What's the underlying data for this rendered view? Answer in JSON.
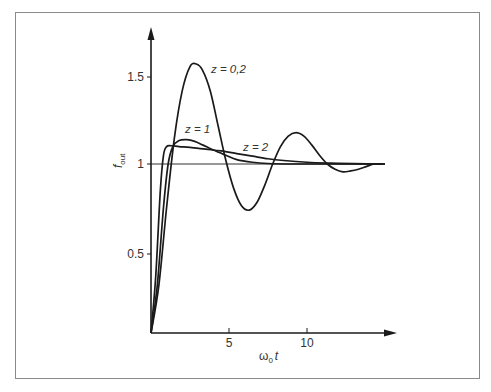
{
  "chart_data": {
    "type": "line",
    "title": "",
    "xlabel": "ω0 t",
    "ylabel": "f_out",
    "xlabel_main": "ω",
    "xlabel_sub": "0",
    "xlabel_var": "t",
    "ylabel_main": "f",
    "ylabel_sub": "out",
    "x_ticks": [
      5,
      10
    ],
    "x_tick_labels": [
      "5",
      "10"
    ],
    "y_ticks": [
      0.5,
      1,
      1.5
    ],
    "y_tick_labels": [
      "0.5",
      "1",
      "1.5"
    ],
    "xlim": [
      0,
      15.5
    ],
    "ylim": [
      0,
      1.75
    ],
    "grid": false,
    "reference_line": {
      "y": 1,
      "x_range": [
        0,
        15
      ]
    },
    "series": [
      {
        "name": "z = 0,2",
        "label": "z = 0,2",
        "x": [
          0,
          0.5,
          1,
          1.5,
          2,
          2.5,
          2.9,
          3.3,
          3.8,
          4.3,
          4.8,
          5.3,
          5.8,
          6.3,
          6.8,
          7.3,
          7.8,
          8.3,
          8.8,
          9.3,
          9.8,
          10.3,
          10.8,
          11.3,
          11.8,
          12.3,
          12.8,
          13.3,
          13.8,
          14.3,
          14.8
        ],
        "values": [
          0.0,
          0.3,
          0.75,
          1.15,
          1.42,
          1.56,
          1.575,
          1.54,
          1.42,
          1.22,
          1.02,
          0.86,
          0.76,
          0.735,
          0.78,
          0.88,
          1.0,
          1.1,
          1.16,
          1.18,
          1.16,
          1.11,
          1.05,
          1.0,
          0.97,
          0.955,
          0.96,
          0.97,
          0.985,
          1.0,
          1.0
        ]
      },
      {
        "name": "z = 1",
        "label": "z = 1",
        "x": [
          0,
          0.4,
          0.8,
          1.1,
          1.4,
          1.8,
          2.3,
          2.8,
          3.3,
          4.0,
          4.8,
          5.5,
          6.5,
          7.5,
          9,
          11,
          13,
          15
        ],
        "values": [
          0.0,
          0.3,
          0.75,
          1.0,
          1.1,
          1.135,
          1.14,
          1.13,
          1.11,
          1.08,
          1.05,
          1.025,
          1.01,
          1.003,
          1.0,
          1.0,
          1.0,
          1.0
        ]
      },
      {
        "name": "z = 2",
        "label": "z = 2",
        "x": [
          0,
          0.3,
          0.6,
          0.8,
          1.0,
          1.3,
          1.8,
          2.5,
          3.5,
          4.5,
          5.5,
          6.5,
          7.5,
          8.5,
          10,
          11.5,
          13,
          15
        ],
        "values": [
          0.0,
          0.35,
          0.85,
          1.05,
          1.1,
          1.105,
          1.1,
          1.095,
          1.085,
          1.075,
          1.06,
          1.045,
          1.03,
          1.02,
          1.01,
          1.005,
          1.002,
          1.0
        ]
      }
    ],
    "annotations": [
      {
        "text": "z = 0,2",
        "near_series": "z = 0,2",
        "x": 3.9,
        "y": 1.56
      },
      {
        "text": "z = 1",
        "near_series": "z = 1",
        "x": 2.0,
        "y": 1.21
      },
      {
        "text": "z = 2",
        "near_series": "z = 2",
        "x": 5.6,
        "y": 1.08
      }
    ]
  },
  "layout": {
    "origin_px": [
      151,
      333
    ],
    "x_px_per_unit": 15.6,
    "y_one_px": 164,
    "y_px_per_unit": 174,
    "x_axis_end_px": 396,
    "y_axis_top_px": 28,
    "line_color": "#1a1a1a",
    "frame_color": "#8a8a8a"
  }
}
